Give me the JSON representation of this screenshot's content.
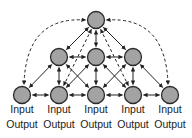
{
  "diagram": {
    "type": "pyramid-network",
    "colors": {
      "node_fill": "#a3a3a3",
      "node_stroke": "#2a2a2a",
      "edge": "#222222"
    },
    "nodes": [
      {
        "id": "top",
        "row": 0,
        "col": 0
      },
      {
        "id": "m0",
        "row": 1,
        "col": 0
      },
      {
        "id": "m1",
        "row": 1,
        "col": 1
      },
      {
        "id": "m2",
        "row": 1,
        "col": 2
      },
      {
        "id": "b0",
        "row": 2,
        "col": 0,
        "label_top": "Input",
        "label_bottom": "Output"
      },
      {
        "id": "b1",
        "row": 2,
        "col": 1,
        "label_top": "Input",
        "label_bottom": "Output"
      },
      {
        "id": "b2",
        "row": 2,
        "col": 2,
        "label_top": "Input",
        "label_bottom": "Output"
      },
      {
        "id": "b3",
        "row": 2,
        "col": 3,
        "label_top": "Input",
        "label_bottom": "Output"
      },
      {
        "id": "b4",
        "row": 2,
        "col": 4,
        "label_top": "Input",
        "label_bottom": "Output"
      }
    ],
    "edges_solid": [
      [
        "top",
        "m0"
      ],
      [
        "top",
        "m1"
      ],
      [
        "top",
        "m2"
      ],
      [
        "m0",
        "m1"
      ],
      [
        "m1",
        "m2"
      ],
      [
        "m0",
        "b0"
      ],
      [
        "m0",
        "b1"
      ],
      [
        "m0",
        "b2"
      ],
      [
        "m1",
        "b1"
      ],
      [
        "m1",
        "b2"
      ],
      [
        "m1",
        "b3"
      ],
      [
        "m2",
        "b2"
      ],
      [
        "m2",
        "b3"
      ],
      [
        "m2",
        "b4"
      ],
      [
        "b0",
        "b1"
      ],
      [
        "b1",
        "b2"
      ],
      [
        "b2",
        "b3"
      ],
      [
        "b3",
        "b4"
      ]
    ],
    "edges_dashed": [
      [
        "top",
        "b0"
      ],
      [
        "top",
        "b4"
      ],
      [
        "top",
        "b1"
      ],
      [
        "top",
        "b3"
      ]
    ]
  }
}
